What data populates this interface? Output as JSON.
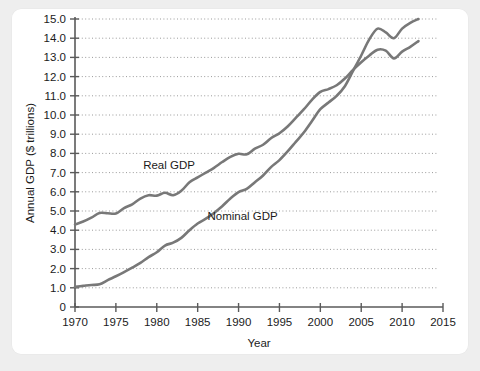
{
  "chart_data": {
    "type": "line",
    "title": "",
    "xlabel": "Year",
    "ylabel": "Annual GDP ($ trillions)",
    "xlim": [
      1970,
      2015
    ],
    "ylim": [
      0,
      15
    ],
    "grid": true,
    "grid_style": "dotted-horizontal",
    "legend": "inline-annotations",
    "xticks": [
      "1970",
      "1975",
      "1980",
      "1985",
      "1990",
      "1995",
      "2000",
      "2005",
      "2010",
      "2015"
    ],
    "xtick_values": [
      1970,
      1975,
      1980,
      1985,
      1990,
      1995,
      2000,
      2005,
      2010,
      2015
    ],
    "yticks": [
      "0",
      "1.0",
      "2.0",
      "3.0",
      "4.0",
      "5.0",
      "6.0",
      "7.0",
      "8.0",
      "9.0",
      "10.0",
      "11.0",
      "12.0",
      "13.0",
      "14.0",
      "15.0"
    ],
    "ytick_values": [
      0,
      1,
      2,
      3,
      4,
      5,
      6,
      7,
      8,
      9,
      10,
      11,
      12,
      13,
      14,
      15
    ],
    "line_color": "#787878",
    "axis_color": "#5a5a5a",
    "x": [
      1970,
      1971,
      1972,
      1973,
      1974,
      1975,
      1976,
      1977,
      1978,
      1979,
      1980,
      1981,
      1982,
      1983,
      1984,
      1985,
      1986,
      1987,
      1988,
      1989,
      1990,
      1991,
      1992,
      1993,
      1994,
      1995,
      1996,
      1997,
      1998,
      1999,
      2000,
      2001,
      2002,
      2003,
      2004,
      2005,
      2006,
      2007,
      2008,
      2009,
      2010,
      2011,
      2012
    ],
    "series": [
      {
        "name": "Real GDP",
        "label_text": "Real GDP",
        "values": [
          4.3,
          4.45,
          4.65,
          4.9,
          4.88,
          4.87,
          5.15,
          5.35,
          5.65,
          5.82,
          5.8,
          5.95,
          5.82,
          6.05,
          6.5,
          6.75,
          7.0,
          7.25,
          7.55,
          7.82,
          7.98,
          7.95,
          8.25,
          8.45,
          8.8,
          9.05,
          9.4,
          9.85,
          10.3,
          10.8,
          11.2,
          11.35,
          11.55,
          11.9,
          12.35,
          12.75,
          13.1,
          13.4,
          13.35,
          12.95,
          13.3,
          13.55,
          13.85
        ]
      },
      {
        "name": "Nominal GDP",
        "label_text": "Nominal GDP",
        "values": [
          1.05,
          1.1,
          1.15,
          1.18,
          1.4,
          1.6,
          1.82,
          2.05,
          2.3,
          2.6,
          2.85,
          3.2,
          3.35,
          3.6,
          4.0,
          4.35,
          4.6,
          4.9,
          5.25,
          5.65,
          5.98,
          6.15,
          6.5,
          6.85,
          7.3,
          7.65,
          8.1,
          8.6,
          9.1,
          9.7,
          10.3,
          10.65,
          11.0,
          11.5,
          12.3,
          13.1,
          13.95,
          14.5,
          14.3,
          14.0,
          14.5,
          14.8,
          15.0
        ]
      }
    ],
    "annotations": [
      {
        "text": "Real GDP",
        "x": 1981.5,
        "y": 7.2
      },
      {
        "text": "Nominal GDP",
        "x": 1990.5,
        "y": 4.55
      }
    ]
  }
}
